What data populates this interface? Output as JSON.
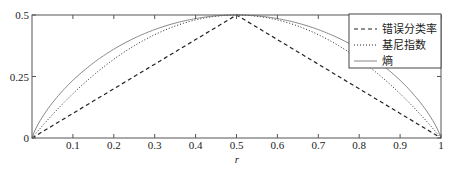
{
  "chart_data": {
    "type": "line",
    "title": "",
    "xlabel": "r",
    "ylabel": "",
    "xlim": [
      0,
      1
    ],
    "ylim": [
      0,
      0.5
    ],
    "grid": false,
    "legend_position": "upper right",
    "x_ticks": [
      "0.1",
      "0.2",
      "0.3",
      "0.4",
      "0.5",
      "0.6",
      "0.7",
      "0.8",
      "0.9",
      "1"
    ],
    "y_ticks": [
      "0",
      "0.25",
      "0.5"
    ],
    "x": [
      0,
      0.05,
      0.1,
      0.15,
      0.2,
      0.25,
      0.3,
      0.35,
      0.4,
      0.45,
      0.5,
      0.55,
      0.6,
      0.65,
      0.7,
      0.75,
      0.8,
      0.85,
      0.9,
      0.95,
      1
    ],
    "series": [
      {
        "name": "错误分类率",
        "style": "dashed",
        "values": [
          0,
          0.05,
          0.1,
          0.15,
          0.2,
          0.25,
          0.3,
          0.35,
          0.4,
          0.45,
          0.5,
          0.45,
          0.4,
          0.35,
          0.3,
          0.25,
          0.2,
          0.15,
          0.1,
          0.05,
          0
        ]
      },
      {
        "name": "基尼指数",
        "style": "dotted",
        "values": [
          0,
          0.095,
          0.18,
          0.255,
          0.32,
          0.375,
          0.42,
          0.455,
          0.48,
          0.495,
          0.5,
          0.495,
          0.48,
          0.455,
          0.42,
          0.375,
          0.32,
          0.255,
          0.18,
          0.095,
          0
        ]
      },
      {
        "name": "熵",
        "style": "solid",
        "values": [
          0,
          0.143,
          0.234,
          0.305,
          0.361,
          0.406,
          0.441,
          0.467,
          0.486,
          0.496,
          0.5,
          0.496,
          0.486,
          0.467,
          0.441,
          0.406,
          0.361,
          0.305,
          0.234,
          0.143,
          0
        ]
      }
    ]
  },
  "legend": {
    "items": [
      {
        "label": "错误分类率"
      },
      {
        "label": "基尼指数"
      },
      {
        "label": "熵"
      }
    ]
  },
  "axes": {
    "xlabel": "r",
    "x_ticks": [
      "0.1",
      "0.2",
      "0.3",
      "0.4",
      "0.5",
      "0.6",
      "0.7",
      "0.8",
      "0.9",
      "1"
    ],
    "y_ticks": [
      "0",
      "0.25",
      "0.5"
    ]
  }
}
